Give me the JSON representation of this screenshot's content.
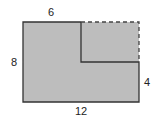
{
  "diagram": {
    "type": "geometry-figure",
    "fill_color": "#bdbdbd",
    "stroke_color": "#333333",
    "labels": {
      "top": "6",
      "left": "8",
      "right": "4",
      "bottom": "12"
    }
  }
}
